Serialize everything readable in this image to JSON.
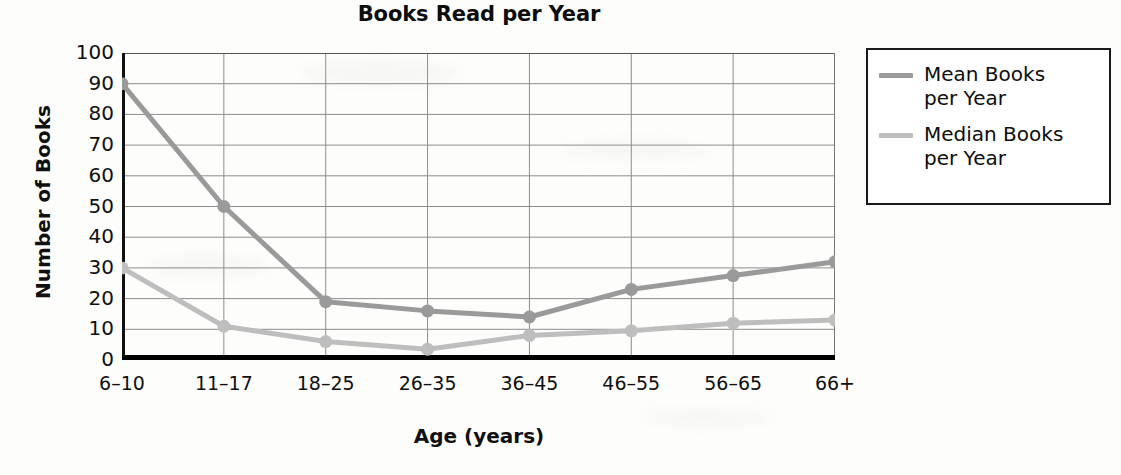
{
  "chart_data": {
    "type": "line",
    "title": "Books Read per Year",
    "xlabel": "Age (years)",
    "ylabel": "Number of Books",
    "categories": [
      "6–10",
      "11–17",
      "18–25",
      "26–35",
      "36–45",
      "46–55",
      "56–65",
      "66+"
    ],
    "series": [
      {
        "name": "Mean Books per Year",
        "legend_line1": "Mean Books",
        "legend_line2": "per Year",
        "color": "#9a9a9a",
        "values": [
          90,
          50,
          19,
          16,
          14,
          23,
          27.5,
          32
        ]
      },
      {
        "name": "Median Books per Year",
        "legend_line1": "Median Books",
        "legend_line2": "per Year",
        "color": "#bebebe",
        "values": [
          30,
          11,
          6,
          3.5,
          8,
          9.5,
          12,
          13
        ]
      }
    ],
    "ylim": [
      0,
      100
    ],
    "ytick_step": 10,
    "yticks": [
      "100",
      "90",
      "80",
      "70",
      "60",
      "50",
      "40",
      "30",
      "20",
      "10",
      "0"
    ],
    "grid": {
      "horizontal": true,
      "vertical": true,
      "color": "#8d8d8d"
    },
    "legend_position": "right-outside",
    "axis_color": "#111111"
  }
}
